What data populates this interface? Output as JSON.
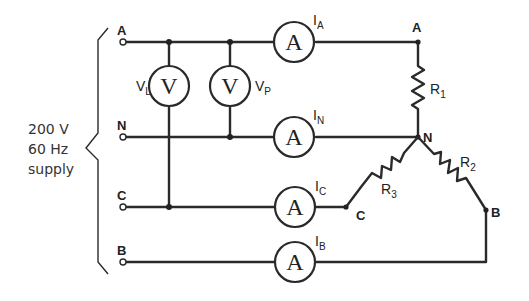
{
  "supply": {
    "line1": "200 V",
    "line2": "60 Hz",
    "line3": "supply"
  },
  "terminals": {
    "A": "A",
    "N": "N",
    "C": "C",
    "B": "B"
  },
  "voltmeters": {
    "symbol": "V",
    "vl": {
      "main": "V",
      "sub": "L"
    },
    "vp": {
      "main": "V",
      "sub": "P"
    }
  },
  "ammeters": {
    "symbol": "A",
    "ia": {
      "main": "I",
      "sub": "A"
    },
    "in": {
      "main": "I",
      "sub": "N"
    },
    "ic": {
      "main": "I",
      "sub": "C"
    },
    "ib": {
      "main": "I",
      "sub": "B"
    }
  },
  "load_nodes": {
    "A": "A",
    "N": "N",
    "C": "C",
    "B": "B"
  },
  "resistors": {
    "r1": {
      "main": "R",
      "sub": "1"
    },
    "r2": {
      "main": "R",
      "sub": "2"
    },
    "r3": {
      "main": "R",
      "sub": "3"
    }
  }
}
